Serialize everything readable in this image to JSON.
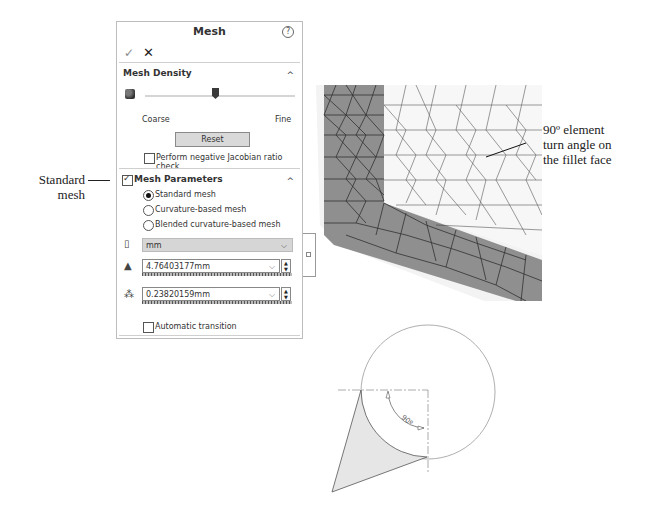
{
  "panel": {
    "title": "Mesh",
    "help_icon": "?",
    "ok_icon": "✓",
    "close_icon": "✕",
    "mesh_density": {
      "header": "Mesh Density",
      "collapse_icon": "^",
      "coarse_label": "Coarse",
      "fine_label": "Fine",
      "reset_label": "Reset",
      "jacobian_check_label": "Perform negative Jacobian ratio check",
      "jacobian_checked": false
    },
    "mesh_parameters": {
      "header": "Mesh Parameters",
      "enabled": true,
      "collapse_icon": "^",
      "options": [
        {
          "label": "Standard mesh",
          "selected": true
        },
        {
          "label": "Curvature-based mesh",
          "selected": false
        },
        {
          "label": "Blended curvature-based mesh",
          "selected": false
        }
      ],
      "unit": "mm",
      "element_size": "4.76403177mm",
      "tolerance": "0.23820159mm",
      "auto_transition_label": "Automatic transition",
      "auto_transition_checked": false
    }
  },
  "annotations": {
    "standard_mesh_line1": "Standard",
    "standard_mesh_line2": "mesh",
    "turn_angle_line1": "90º element",
    "turn_angle_line2": "turn angle on",
    "turn_angle_line3": "the fillet face",
    "angle_label": "90º"
  },
  "colors": {
    "mesh_dark_face": "#8c8c8c",
    "mesh_light_face": "#f4f4f4",
    "diagram_fill": "#e8e8e8"
  }
}
